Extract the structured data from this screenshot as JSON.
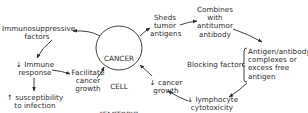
{
  "center": {
    "line1": "CANCER",
    "line2": "CELL",
    "line3": "\"FACTORY\""
  },
  "nodes": {
    "immunosuppressive": "Immunosuppressive\nfactors",
    "immune_response": "↓ Immune\nresponse",
    "susceptibility": "↑ susceptibility\nto infection",
    "facilitate": "Facilitate\ncancer\ngrowth",
    "sheds": "Sheds\ntumor\nantigens",
    "combines": "Combines\nwith\nantitumor\nantibody",
    "complexes": "Antigen/antibody\ncomplexes or\nexcess free\nantigen",
    "blocking": "Blocking factors",
    "cancer_growth": "↓ cancer\ngrowth",
    "lymphocyte": "↓ lymphocyte\ncytotoxicity"
  },
  "colors": {
    "ink": "#2a2a2a",
    "background": "#ffffff"
  }
}
